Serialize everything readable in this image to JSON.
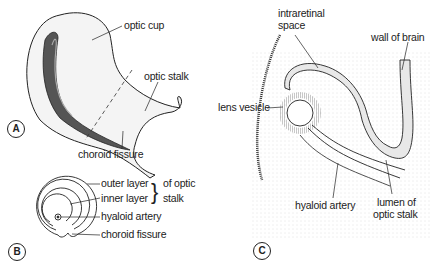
{
  "panels": [
    {
      "id": "A",
      "labels": [
        "optic cup",
        "optic stalk",
        "choroid fissure"
      ]
    },
    {
      "id": "B",
      "labels": [
        "outer layer",
        "inner layer",
        "of optic stalk",
        "hyaloid artery",
        "choroid fissure"
      ]
    },
    {
      "id": "C",
      "labels": [
        "intraretinal space",
        "wall of brain",
        "lens vesicle",
        "hyaloid artery",
        "lumen of optic stalk"
      ]
    }
  ],
  "A": {
    "badge": "A",
    "optic_cup": "optic cup",
    "optic_stalk": "optic stalk",
    "choroid_fissure": "choroid fissure"
  },
  "B": {
    "badge": "B",
    "outer_layer": "outer layer",
    "inner_layer": "inner layer",
    "of_optic": "of optic",
    "stalk": "stalk",
    "brace": "}",
    "hyaloid_artery": "hyaloid artery",
    "choroid_fissure": "choroid fissure"
  },
  "C": {
    "badge": "C",
    "intraretinal": "intraretinal",
    "space": "space",
    "wall_of_brain": "wall of brain",
    "lens_vesicle": "lens vesicle",
    "hyaloid_artery": "hyaloid artery",
    "lumen_of": "lumen of",
    "optic_stalk": "optic stalk"
  }
}
